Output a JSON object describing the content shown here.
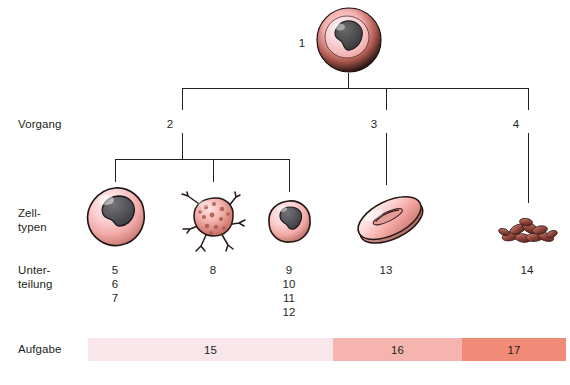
{
  "row_labels": {
    "vorgang": "Vorgang",
    "zelltypen": "Zell-\ntypen",
    "unterteilung": "Unter-\nteilung",
    "aufgabe": "Aufgabe"
  },
  "nodes": {
    "stem_cell_label": "1",
    "branch1_label": "2",
    "branch2_label": "3",
    "branch3_label": "4"
  },
  "subdivision_numbers": {
    "col1": "5\n6\n7",
    "col2": "8",
    "col3": "9\n10\n11\n12",
    "col4": "13",
    "col5": "14"
  },
  "task_bar": {
    "segments": [
      {
        "label": "15",
        "color": "#f8e6ea",
        "left": 0,
        "width": 245
      },
      {
        "label": "16",
        "color": "#f6b4ae",
        "left": 245,
        "width": 129
      },
      {
        "label": "17",
        "color": "#f28a78",
        "left": 374,
        "width": 104
      }
    ]
  },
  "cells": [
    {
      "name": "stem-cell",
      "label": "1"
    },
    {
      "name": "monocyte-cell",
      "label": "5"
    },
    {
      "name": "megakaryocyte-cell",
      "label": "8"
    },
    {
      "name": "lymphocyte-cell",
      "label": "9"
    },
    {
      "name": "erythrocyte-cell",
      "label": "13"
    },
    {
      "name": "platelets-cluster",
      "label": "14"
    }
  ],
  "colors": {
    "line": "#231f20",
    "cell_pink_light": "#fbd9dc",
    "cell_pink": "#f3a9a9",
    "cell_pink_dark": "#d9736d",
    "nucleus": "#555558",
    "nucleus_dark": "#3b3b3e",
    "outline": "#231f20",
    "platelet": "#8e3a32",
    "background": "#ffffff"
  }
}
